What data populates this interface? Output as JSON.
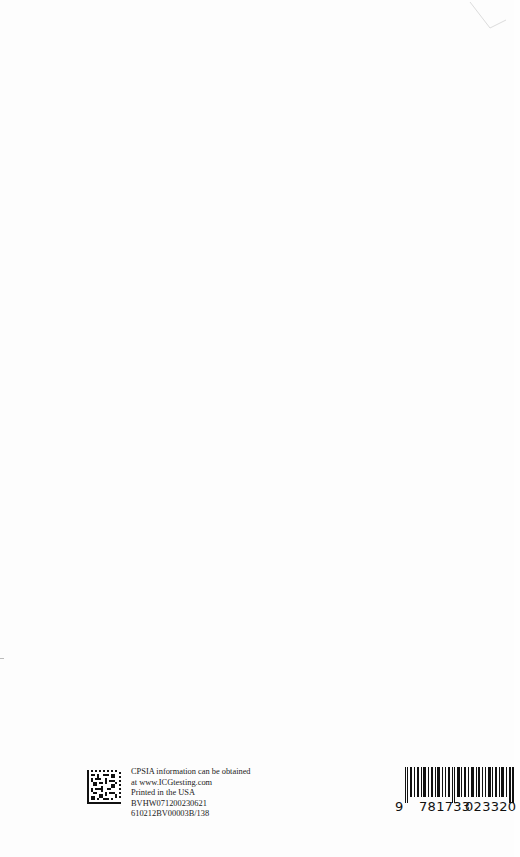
{
  "page": {
    "type": "book back page (printer colophon)",
    "background": "#fdfdfd"
  },
  "colophon": {
    "lines": [
      "CPSIA information can be obtained",
      "at www.ICGtesting.com",
      "Printed in the USA",
      "BVHW071200230621",
      "610212BV00003B/138"
    ]
  },
  "barcode": {
    "lead_digit": "9",
    "group1": "781733",
    "group2": "023320",
    "full": "9781733023320"
  },
  "icons": {
    "qr": "data-matrix-code-icon",
    "barcode": "isbn-barcode-icon"
  }
}
